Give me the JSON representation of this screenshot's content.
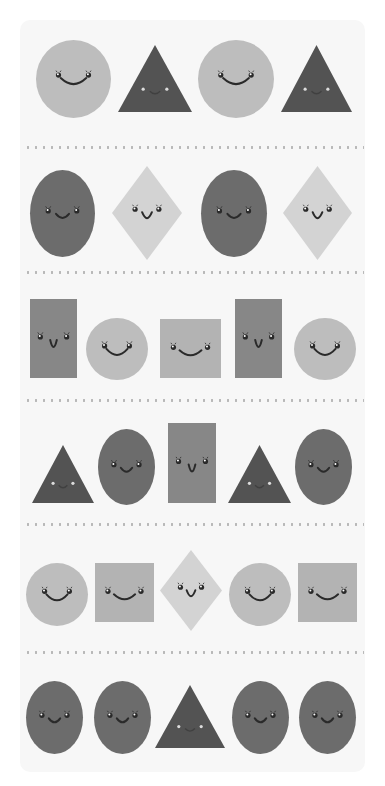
{
  "colors": {
    "page_bg": "#ffffff",
    "card_bg": "#f7f7f7",
    "dot": "#b8b8b8",
    "circle": "#bdbdbd",
    "triangle": "#535353",
    "ellipse": "#6c6c6c",
    "diamond": "#d3d3d3",
    "rectangle": "#878787",
    "square": "#b3b3b3",
    "face": "#2a2a2a"
  },
  "dividers_y": [
    147,
    272,
    400,
    524,
    652
  ],
  "rows": [
    {
      "shapes": [
        {
          "type": "circle",
          "x": 36,
          "y": 40,
          "w": 75,
          "h": 78
        },
        {
          "type": "triangle",
          "x": 118,
          "y": 45,
          "w": 74,
          "h": 67
        },
        {
          "type": "circle",
          "x": 198,
          "y": 40,
          "w": 76,
          "h": 78
        },
        {
          "type": "triangle",
          "x": 281,
          "y": 45,
          "w": 71,
          "h": 67
        }
      ]
    },
    {
      "shapes": [
        {
          "type": "ellipse",
          "x": 30,
          "y": 170,
          "w": 65,
          "h": 87
        },
        {
          "type": "diamond",
          "x": 112,
          "y": 166,
          "w": 70,
          "h": 94
        },
        {
          "type": "ellipse",
          "x": 201,
          "y": 170,
          "w": 66,
          "h": 87
        },
        {
          "type": "diamond",
          "x": 283,
          "y": 166,
          "w": 69,
          "h": 94
        }
      ]
    },
    {
      "shapes": [
        {
          "type": "rectangle",
          "x": 30,
          "y": 299,
          "w": 47,
          "h": 79
        },
        {
          "type": "circle",
          "x": 86,
          "y": 318,
          "w": 62,
          "h": 62
        },
        {
          "type": "square",
          "x": 160,
          "y": 319,
          "w": 61,
          "h": 59
        },
        {
          "type": "rectangle",
          "x": 235,
          "y": 299,
          "w": 47,
          "h": 79
        },
        {
          "type": "circle",
          "x": 294,
          "y": 318,
          "w": 62,
          "h": 62
        }
      ]
    },
    {
      "shapes": [
        {
          "type": "triangle",
          "x": 32,
          "y": 445,
          "w": 62,
          "h": 58
        },
        {
          "type": "ellipse",
          "x": 98,
          "y": 429,
          "w": 57,
          "h": 76
        },
        {
          "type": "rectangle",
          "x": 168,
          "y": 423,
          "w": 48,
          "h": 80
        },
        {
          "type": "triangle",
          "x": 228,
          "y": 445,
          "w": 63,
          "h": 58
        },
        {
          "type": "ellipse",
          "x": 295,
          "y": 429,
          "w": 57,
          "h": 76
        }
      ]
    },
    {
      "shapes": [
        {
          "type": "circle",
          "x": 26,
          "y": 563,
          "w": 62,
          "h": 63
        },
        {
          "type": "square",
          "x": 95,
          "y": 563,
          "w": 59,
          "h": 59
        },
        {
          "type": "diamond",
          "x": 160,
          "y": 550,
          "w": 62,
          "h": 81
        },
        {
          "type": "circle",
          "x": 229,
          "y": 563,
          "w": 62,
          "h": 63
        },
        {
          "type": "square",
          "x": 298,
          "y": 563,
          "w": 59,
          "h": 59
        }
      ]
    },
    {
      "shapes": [
        {
          "type": "ellipse",
          "x": 26,
          "y": 681,
          "w": 57,
          "h": 73
        },
        {
          "type": "ellipse",
          "x": 94,
          "y": 681,
          "w": 57,
          "h": 73
        },
        {
          "type": "triangle",
          "x": 155,
          "y": 685,
          "w": 70,
          "h": 63
        },
        {
          "type": "ellipse",
          "x": 232,
          "y": 681,
          "w": 57,
          "h": 73
        },
        {
          "type": "ellipse",
          "x": 299,
          "y": 681,
          "w": 57,
          "h": 73
        }
      ]
    }
  ]
}
